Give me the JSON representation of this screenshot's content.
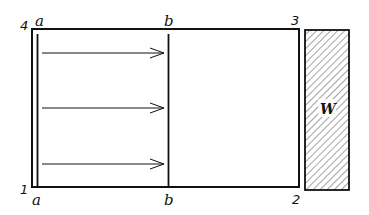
{
  "diagram": {
    "corners": {
      "top_left": "4",
      "top_right": "3",
      "bottom_right": "2",
      "bottom_left": "1"
    },
    "lines": {
      "a": {
        "top_label": "a",
        "bottom_label": "a"
      },
      "b": {
        "top_label": "b",
        "bottom_label": "b"
      }
    },
    "arrows": [
      {
        "y": 53,
        "direction": "right"
      },
      {
        "y": 108,
        "direction": "right"
      },
      {
        "y": 164,
        "direction": "right"
      }
    ],
    "wall": {
      "label": "W",
      "fill": "hatched"
    },
    "colors": {
      "stroke": "#111111",
      "background": "#ffffff"
    }
  }
}
